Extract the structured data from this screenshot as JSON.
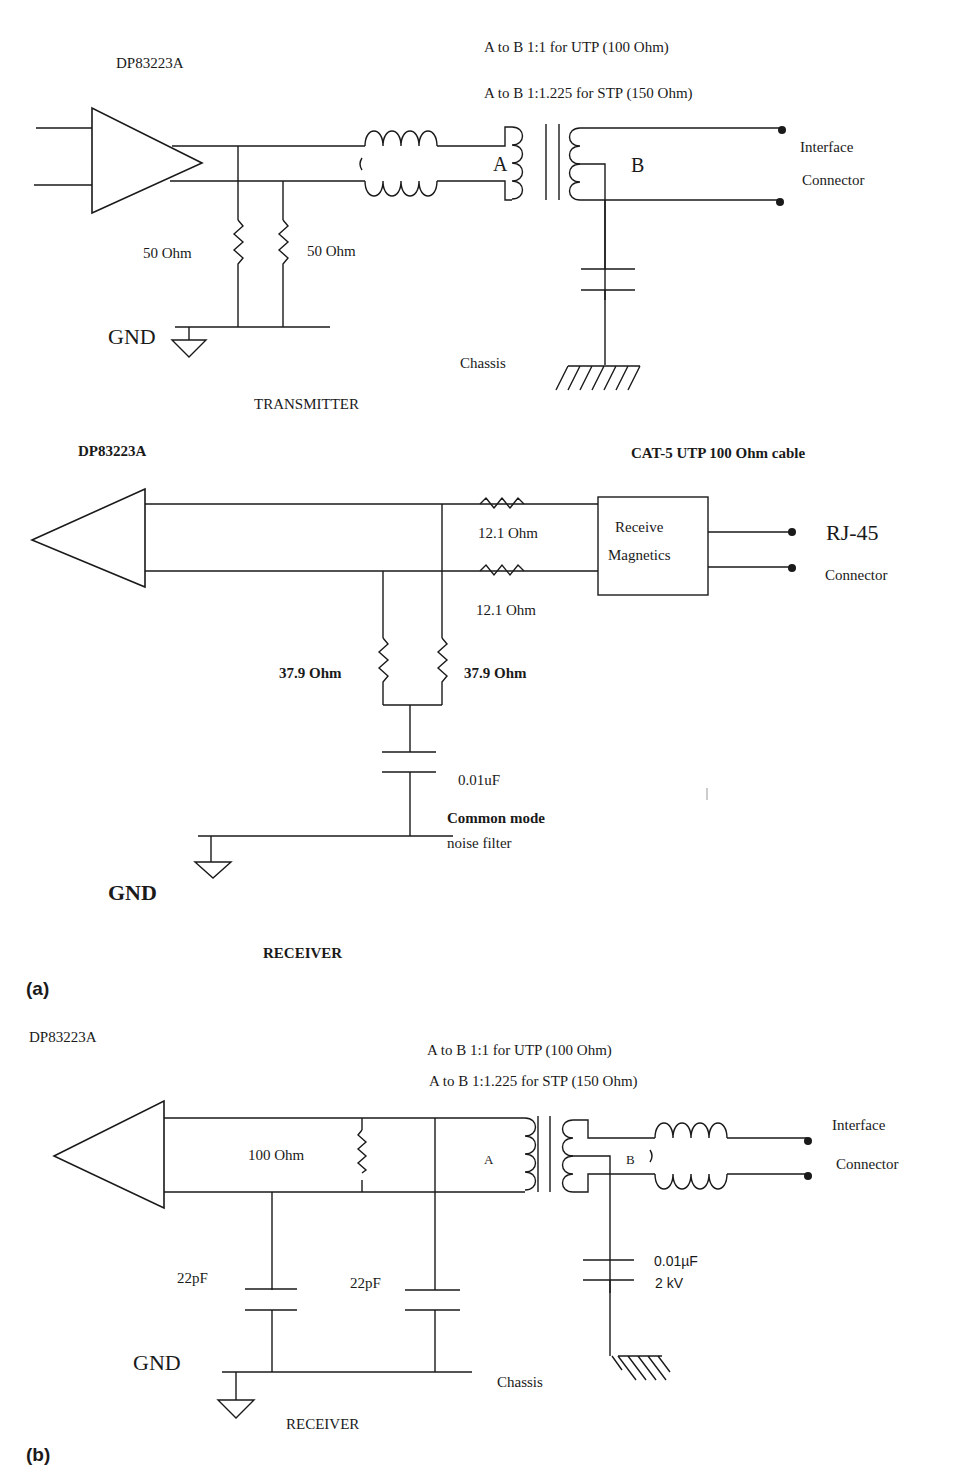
{
  "figure": {
    "panel_a": {
      "label": "(a)",
      "transmitter": {
        "chip_label": "DP83223A",
        "ratio_utp": "A to B 1:1 for UTP (100 Ohm)",
        "ratio_stp": "A to B 1:1.225 for STP (150 Ohm)",
        "resistor_left": "50 Ohm",
        "resistor_right": "50 Ohm",
        "primary_label": "A",
        "secondary_label": "B",
        "connector_line1": "Interface",
        "connector_line2": "Connector",
        "gnd_label": "GND",
        "chassis_label": "Chassis",
        "title": "TRANSMITTER"
      },
      "receiver": {
        "chip_label": "DP83223A",
        "cable_label": "CAT-5 UTP 100 Ohm cable",
        "series_resistor_top": "12.1 Ohm",
        "series_resistor_bottom": "12.1 Ohm",
        "magnetics_line1": "Receive",
        "magnetics_line2": "Magnetics",
        "connector_line1": "RJ-45",
        "connector_line2": "Connector",
        "shunt_resistor_left": "37.9 Ohm",
        "shunt_resistor_right": "37.9 Ohm",
        "cap_label": "0.01uF",
        "filter_line1": "Common mode",
        "filter_line2": "noise filter",
        "gnd_label": "GND",
        "title": "RECEIVER"
      }
    },
    "panel_b": {
      "label": "(b)",
      "receiver": {
        "chip_label": "DP83223A",
        "ratio_utp": "A to B 1:1 for UTP (100 Ohm)",
        "ratio_stp": "A to B 1:1.225 for STP (150 Ohm)",
        "termination_resistor": "100 Ohm",
        "primary_label": "A",
        "secondary_label": "B",
        "cap_left": "22pF",
        "cap_right": "22pF",
        "hv_cap_value": "0.01µF",
        "hv_cap_voltage": "2 kV",
        "connector_line1": "Interface",
        "connector_line2": "Connector",
        "gnd_label": "GND",
        "chassis_label": "Chassis",
        "title": "RECEIVER"
      }
    }
  }
}
